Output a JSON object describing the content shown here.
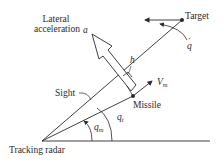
{
  "diagram": {
    "title": "",
    "colors": {
      "line": "#2a2a2a",
      "background": "#ffffff"
    },
    "labels": {
      "lateral_acceleration_line1": "Lateral",
      "lateral_acceleration_line2": "acceleration",
      "accel_symbol": "a",
      "target": "Target",
      "q_dot_symbol": "q",
      "q_dot_dot": "·",
      "h_symbol": "h",
      "velocity_symbol": "V",
      "velocity_sub": "m",
      "sight": "Sight",
      "missile": "Missile",
      "q_m_symbol": "q",
      "q_m_sub": "m",
      "q_t_symbol": "q",
      "q_t_sub": "t",
      "tracking_radar": "Tracking radar"
    },
    "nodes": [
      {
        "id": "tracking-radar",
        "label": "Tracking radar"
      },
      {
        "id": "missile",
        "label": "Missile"
      },
      {
        "id": "target",
        "label": "Target"
      }
    ],
    "edges": [
      {
        "from": "tracking-radar",
        "to": "target",
        "label": "Sight line (angle q_t)"
      },
      {
        "from": "tracking-radar",
        "to": "missile",
        "label": "Missile line (angle q_m)"
      }
    ]
  }
}
